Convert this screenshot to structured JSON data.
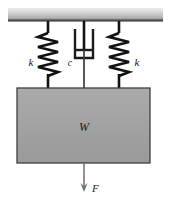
{
  "figure": {
    "background_color": "#ffffff",
    "line_color": "#1b1b1b",
    "fill_gray": "#a3a3a3",
    "ceiling_gray_top": "#e2e2e2",
    "ceiling_gray_bottom": "#9a9a9a"
  },
  "labels": {
    "spring_left": "k",
    "damper": "c",
    "spring_right": "k",
    "mass": "W",
    "force": "F"
  },
  "components": {
    "ceiling": {
      "name": "ceiling-support",
      "x": 8,
      "y": 8,
      "width": 155,
      "height": 13
    },
    "spring_left": {
      "name": "spring-left",
      "center_x": 48,
      "top_y": 31,
      "bottom_y": 80,
      "coil_width": 19,
      "coils": 7
    },
    "spring_right": {
      "name": "spring-right",
      "center_x": 119,
      "top_y": 31,
      "bottom_y": 80,
      "coil_width": 19,
      "coils": 7
    },
    "damper": {
      "name": "damper-dashpot",
      "center_x": 84,
      "cylinder_top_y": 29,
      "cylinder_bottom_y": 59,
      "cylinder_width": 19,
      "piston_y": 50
    },
    "mass_block": {
      "name": "mass-block",
      "x": 17,
      "y": 88,
      "width": 133,
      "height": 75
    },
    "force_arrow": {
      "name": "force-arrow",
      "x": 84,
      "from_y": 163,
      "to_y": 192,
      "direction": "down"
    }
  },
  "label_positions": {
    "spring_left": {
      "x": 31,
      "y": 63
    },
    "damper": {
      "x": 71,
      "y": 64
    },
    "spring_right": {
      "x": 136,
      "y": 63
    },
    "mass": {
      "x": 84,
      "y": 131
    },
    "force": {
      "x": 94,
      "y": 192
    }
  }
}
